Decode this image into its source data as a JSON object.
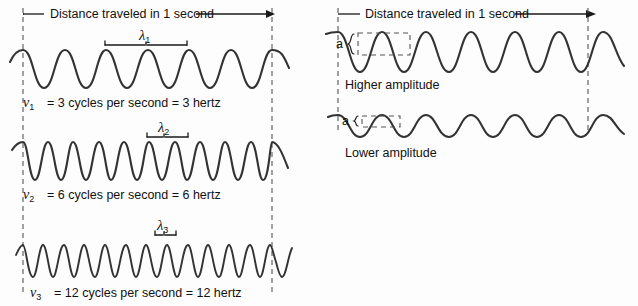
{
  "figure": {
    "background_color": "#fdfdfd",
    "wave_color": "#333333",
    "guide_color": "#555555"
  },
  "left_panel": {
    "header_label": "Distance traveled in 1 second",
    "waves": [
      {
        "wavelength_symbol": "λ",
        "wavelength_subscript": "1",
        "frequency_symbol": "ν",
        "frequency_subscript": "1",
        "frequency_text": "= 3 cycles per second = 3 hertz",
        "cycles": 3
      },
      {
        "wavelength_symbol": "λ",
        "wavelength_subscript": "2",
        "frequency_symbol": "ν",
        "frequency_subscript": "2",
        "frequency_text": "= 6 cycles per second = 6 hertz",
        "cycles": 6
      },
      {
        "wavelength_symbol": "λ",
        "wavelength_subscript": "3",
        "frequency_symbol": "ν",
        "frequency_subscript": "3",
        "frequency_text": "= 12 cycles per second = 12 hertz",
        "cycles": 12
      }
    ]
  },
  "right_panel": {
    "header_label": "Distance traveled in 1 second",
    "waves": [
      {
        "amplitude_symbol": "a",
        "caption": "Higher amplitude",
        "cycles": 3
      },
      {
        "amplitude_symbol": "a",
        "caption": "Lower amplitude",
        "cycles": 3
      }
    ]
  }
}
